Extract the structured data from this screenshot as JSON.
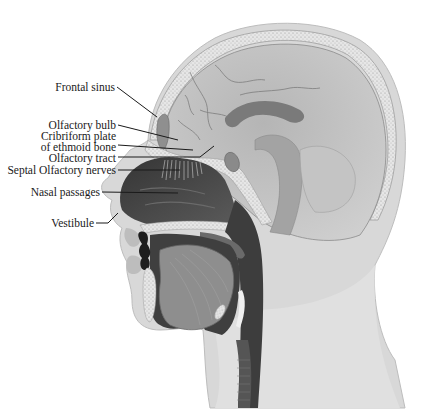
{
  "figure": {
    "labels": [
      {
        "id": "frontal-sinus",
        "text": "Frontal sinus"
      },
      {
        "id": "olfactory-bulb",
        "text": "Olfactory bulb"
      },
      {
        "id": "cribriform-plate-1",
        "text": "Cribriform plate"
      },
      {
        "id": "cribriform-plate-2",
        "text": "of ethmoid bone"
      },
      {
        "id": "olfactory-tract",
        "text": "Olfactory tract"
      },
      {
        "id": "septal-olfactory-nerves",
        "text": "Septal Olfactory nerves"
      },
      {
        "id": "nasal-passages",
        "text": "Nasal passages"
      },
      {
        "id": "vestibule",
        "text": "Vestibule"
      }
    ],
    "colors": {
      "skin": "#d9d9d9",
      "skull_bone": "#e4e4e4",
      "brain": "#bdbdbd",
      "nasal_cavity": "#4a4a4a",
      "tongue": "#8c8c8c",
      "pharynx": "#3a3a3a",
      "label_text": "#1a1a1a"
    }
  }
}
